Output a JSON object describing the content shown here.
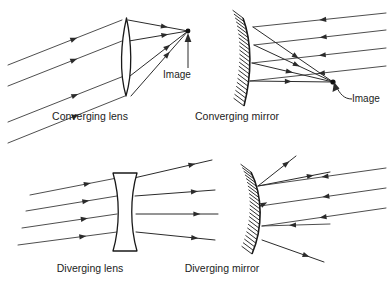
{
  "figure": {
    "background_color": "#ffffff",
    "ray_color": "#3a3a3a",
    "outline_color": "#1a1a1a",
    "width": 390,
    "height": 288
  },
  "panels": [
    {
      "id": "converging-lens",
      "caption": "Converging lens",
      "optic_type": "biconvex-lens",
      "caption_x": 90,
      "caption_y": 120,
      "image_label": "Image",
      "image_label_x": 177,
      "image_label_y": 78,
      "image_point": {
        "x": 188,
        "y": 31
      },
      "incoming_rays": [
        {
          "x1": 8,
          "y1": 65,
          "x2": 122,
          "y2": 20,
          "arrow_t": 0.55
        },
        {
          "x1": 8,
          "y1": 86,
          "x2": 122,
          "y2": 41,
          "arrow_t": 0.55
        },
        {
          "x1": 8,
          "y1": 122,
          "x2": 124,
          "y2": 76,
          "arrow_t": 0.55
        },
        {
          "x1": 8,
          "y1": 143,
          "x2": 125,
          "y2": 96,
          "arrow_t": 0.55
        }
      ],
      "outgoing_rays": [
        {
          "x1": 128,
          "y1": 20,
          "x2": 188,
          "y2": 31,
          "arrow_t": 0.55
        },
        {
          "x1": 129,
          "y1": 41,
          "x2": 188,
          "y2": 31,
          "arrow_t": 0.55
        },
        {
          "x1": 130,
          "y1": 76,
          "x2": 188,
          "y2": 31,
          "arrow_t": 0.6
        },
        {
          "x1": 131,
          "y1": 96,
          "x2": 188,
          "y2": 31,
          "arrow_t": 0.6
        }
      ]
    },
    {
      "id": "converging-mirror",
      "caption": "Converging mirror",
      "optic_type": "concave-mirror",
      "caption_x": 237,
      "caption_y": 120,
      "image_label": "Image",
      "image_label_x": 352,
      "image_label_y": 102,
      "image_point": {
        "x": 333,
        "y": 82
      },
      "incoming_rays": [
        {
          "x1": 386,
          "y1": 13,
          "x2": 253,
          "y2": 27,
          "arrow_t": 0.45
        },
        {
          "x1": 386,
          "y1": 30,
          "x2": 254,
          "y2": 45,
          "arrow_t": 0.45
        },
        {
          "x1": 386,
          "y1": 48,
          "x2": 252,
          "y2": 63,
          "arrow_t": 0.45
        },
        {
          "x1": 386,
          "y1": 66,
          "x2": 250,
          "y2": 81,
          "arrow_t": 0.45
        }
      ],
      "outgoing_rays": [
        {
          "x1": 253,
          "y1": 27,
          "x2": 333,
          "y2": 82,
          "arrow_t": 0.5
        },
        {
          "x1": 254,
          "y1": 45,
          "x2": 333,
          "y2": 82,
          "arrow_t": 0.5
        },
        {
          "x1": 252,
          "y1": 63,
          "x2": 333,
          "y2": 82,
          "arrow_t": 0.42
        },
        {
          "x1": 250,
          "y1": 81,
          "x2": 333,
          "y2": 82,
          "arrow_t": 0.42
        }
      ]
    },
    {
      "id": "diverging-lens",
      "caption": "Diverging lens",
      "optic_type": "biconcave-lens",
      "caption_x": 90,
      "caption_y": 272,
      "incoming_rays": [
        {
          "x1": 30,
          "y1": 195,
          "x2": 117,
          "y2": 178,
          "arrow_t": 0.62
        },
        {
          "x1": 26,
          "y1": 211,
          "x2": 117,
          "y2": 196,
          "arrow_t": 0.62
        },
        {
          "x1": 22,
          "y1": 228,
          "x2": 117,
          "y2": 214,
          "arrow_t": 0.62
        },
        {
          "x1": 18,
          "y1": 245,
          "x2": 117,
          "y2": 232,
          "arrow_t": 0.62
        }
      ],
      "outgoing_rays": [
        {
          "x1": 134,
          "y1": 178,
          "x2": 212,
          "y2": 160,
          "arrow_t": 0.7
        },
        {
          "x1": 135,
          "y1": 196,
          "x2": 215,
          "y2": 190,
          "arrow_t": 0.7
        },
        {
          "x1": 136,
          "y1": 214,
          "x2": 218,
          "y2": 214,
          "arrow_t": 0.7
        },
        {
          "x1": 136,
          "y1": 232,
          "x2": 215,
          "y2": 240,
          "arrow_t": 0.7
        }
      ]
    },
    {
      "id": "diverging-mirror",
      "caption": "Diverging mirror",
      "optic_type": "convex-mirror",
      "caption_x": 222,
      "caption_y": 272,
      "incoming_rays": [
        {
          "x1": 386,
          "y1": 168,
          "x2": 258,
          "y2": 186,
          "arrow_t": 0.45
        },
        {
          "x1": 386,
          "y1": 188,
          "x2": 260,
          "y2": 206,
          "arrow_t": 0.45
        },
        {
          "x1": 386,
          "y1": 208,
          "x2": 262,
          "y2": 226,
          "arrow_t": 0.48
        },
        {
          "x1": 330,
          "y1": 224,
          "x2": 262,
          "y2": 226,
          "arrow_t": 0.5
        }
      ],
      "outgoing_rays": [
        {
          "x1": 258,
          "y1": 186,
          "x2": 296,
          "y2": 156,
          "arrow_t": 0.68
        },
        {
          "x1": 258,
          "y1": 186,
          "x2": 330,
          "y2": 172,
          "arrow_t": 0.68
        },
        {
          "x1": 260,
          "y1": 206,
          "x2": 262,
          "y2": 205,
          "arrow_t": 0.5
        },
        {
          "x1": 262,
          "y1": 240,
          "x2": 324,
          "y2": 262,
          "arrow_t": 0.66
        }
      ]
    }
  ]
}
